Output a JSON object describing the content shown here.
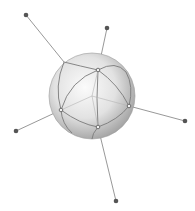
{
  "diagram": {
    "sphere": {
      "cx": 92,
      "cy": 96,
      "r": 43,
      "fill_light": "#f7f7f7",
      "fill_dark": "#9a9a9a",
      "edge_color": "#777777"
    },
    "line_color": "#8c8c8c",
    "node_color": "#555555",
    "surface_nodes": [
      {
        "id": "n1",
        "x": 98,
        "y": 70
      },
      {
        "id": "n2",
        "x": 129,
        "y": 106
      },
      {
        "id": "n3",
        "x": 98,
        "y": 127
      },
      {
        "id": "n4",
        "x": 61,
        "y": 110
      },
      {
        "id": "n5",
        "x": 64,
        "y": 62
      }
    ],
    "endpoints": [
      {
        "id": "e1",
        "x": 26,
        "y": 15
      },
      {
        "id": "e2",
        "x": 107,
        "y": 28
      },
      {
        "id": "e3",
        "x": 185,
        "y": 121
      },
      {
        "id": "e4",
        "x": 116,
        "y": 201
      },
      {
        "id": "e5",
        "x": 16,
        "y": 131
      }
    ]
  }
}
